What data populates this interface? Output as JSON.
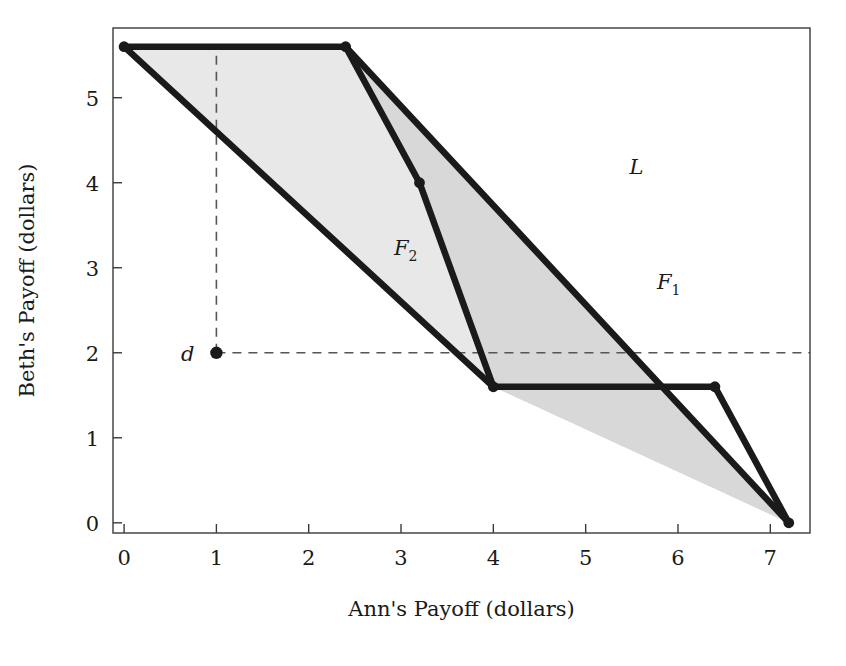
{
  "chart_data": {
    "type": "area",
    "title": "",
    "xlabel": "Ann's Payoff (dollars)",
    "ylabel": "Beth's Payoff (dollars)",
    "xlim": [
      -0.12,
      7.43
    ],
    "ylim": [
      -0.12,
      5.82
    ],
    "xticks": [
      0,
      1,
      2,
      3,
      4,
      5,
      6,
      7
    ],
    "xtick_labels": [
      "0",
      "1",
      "2",
      "3",
      "4",
      "5",
      "6",
      "7"
    ],
    "yticks": [
      0,
      1,
      2,
      3,
      4,
      5
    ],
    "ytick_labels": [
      "0",
      "1",
      "2",
      "3",
      "4",
      "5"
    ],
    "grid": false,
    "legend": "none",
    "frame": true,
    "fill_color": "#e8e8e8",
    "fill_color_overlap": "#d8d8d8",
    "line_color": "#1a1a1a",
    "dash_color": "#555555",
    "regions": [
      {
        "name": "F_2",
        "label": "F",
        "label_sub": "2",
        "label_at": [
          3.05,
          3.15
        ],
        "vertices": [
          [
            0,
            5.6
          ],
          [
            2.4,
            5.6
          ],
          [
            3.2,
            4.0
          ],
          [
            4.0,
            1.6
          ]
        ]
      },
      {
        "name": "F_1",
        "label": "F",
        "label_sub": "1",
        "label_at": [
          5.9,
          2.75
        ],
        "vertices": [
          [
            2.4,
            5.6
          ],
          [
            7.2,
            0.0
          ],
          [
            4.0,
            1.6
          ],
          [
            3.2,
            4.0
          ]
        ]
      }
    ],
    "segments": [
      {
        "name": "L",
        "from": [
          2.4,
          5.6
        ],
        "to": [
          7.2,
          0.0
        ],
        "label": "L",
        "label_at": [
          5.55,
          4.1
        ]
      },
      {
        "name": "top-edge",
        "from": [
          0,
          5.6
        ],
        "to": [
          2.4,
          5.6
        ],
        "label": "",
        "label_at": null
      },
      {
        "name": "f2-upper-right",
        "from": [
          2.4,
          5.6
        ],
        "to": [
          3.2,
          4.0
        ],
        "label": "",
        "label_at": null
      },
      {
        "name": "f2-lower-right",
        "from": [
          3.2,
          4.0
        ],
        "to": [
          4.0,
          1.6
        ],
        "label": "",
        "label_at": null
      },
      {
        "name": "f2-left-edge",
        "from": [
          0,
          5.6
        ],
        "to": [
          4.0,
          1.6
        ],
        "label": "",
        "label_at": null
      },
      {
        "name": "bottom-edge",
        "from": [
          4.0,
          1.6
        ],
        "to": [
          6.4,
          1.6
        ],
        "label": "",
        "label_at": null
      },
      {
        "name": "f1-lower-right",
        "from": [
          6.4,
          1.6
        ],
        "to": [
          7.2,
          0.0
        ],
        "label": "",
        "label_at": null
      }
    ],
    "markers": [
      {
        "name": "vertex-0-5.6",
        "x": 0,
        "y": 5.6
      },
      {
        "name": "vertex-2.4-5.6",
        "x": 2.4,
        "y": 5.6
      },
      {
        "name": "vertex-3.2-4.0",
        "x": 3.2,
        "y": 4.0
      },
      {
        "name": "vertex-4.0-1.6",
        "x": 4.0,
        "y": 1.6
      },
      {
        "name": "vertex-6.4-1.6",
        "x": 6.4,
        "y": 1.6
      },
      {
        "name": "vertex-7.2-0.0",
        "x": 7.2,
        "y": 0.0
      }
    ],
    "disagreement_point": {
      "name": "d",
      "label": "d",
      "x": 1,
      "y": 2,
      "dashed_vertical_to_y": 5.6,
      "dashed_horizontal_to_x": 7.43
    }
  }
}
